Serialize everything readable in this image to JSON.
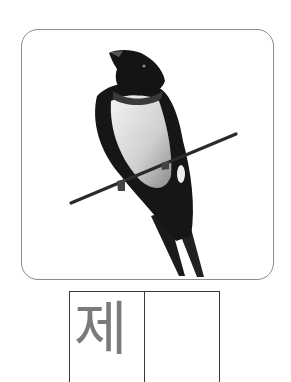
{
  "card": {
    "image": "swallow-on-wire-illustration",
    "frame_color": "#8c8c8c"
  },
  "writing_grid": {
    "cells": [
      {
        "syllable": "제"
      },
      {
        "syllable": ""
      }
    ],
    "trace_color": "#7a7a7a",
    "line_color": "#3a3a3a"
  }
}
